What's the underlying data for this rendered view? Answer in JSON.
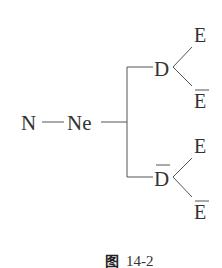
{
  "diagram": {
    "root": "N",
    "second": "Ne",
    "branches": [
      {
        "node": "D",
        "overbar": false,
        "children": [
          {
            "label": "E",
            "overbar": false
          },
          {
            "label": "E",
            "overbar": true
          }
        ]
      },
      {
        "node": "D",
        "overbar": true,
        "children": [
          {
            "label": "E",
            "overbar": false
          },
          {
            "label": "E",
            "overbar": true
          }
        ]
      }
    ]
  },
  "caption": {
    "prefix": "图",
    "number": "14-2"
  }
}
